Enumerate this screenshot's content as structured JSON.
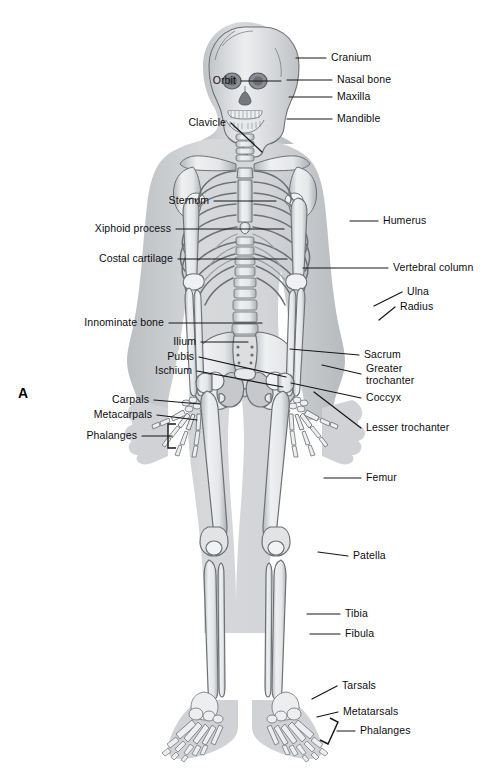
{
  "figure": {
    "panel_letter": "A",
    "view": "anterior"
  },
  "palette": {
    "background": "#ffffff",
    "body_silhouette": "#c9cbcd",
    "body_silhouette_light": "#d8dadc",
    "bone_fill": "#e9eaec",
    "bone_fill_light": "#f2f3f4",
    "bone_shade": "#b0b3b6",
    "bone_outline": "#6d7175",
    "leader_line": "#16161a",
    "label_text": "#0d0d12"
  },
  "labels_left": [
    {
      "id": "orbit",
      "text": "Orbit",
      "x": 236,
      "y": 81,
      "tip_x": 281,
      "tip_y": 81
    },
    {
      "id": "clavicle",
      "text": "Clavicle",
      "x": 226,
      "y": 123,
      "tip_x": 262,
      "tip_y": 152
    },
    {
      "id": "sternum",
      "text": "Sternum",
      "x": 209,
      "y": 201,
      "tip_x": 276,
      "tip_y": 201
    },
    {
      "id": "xiphoid-process",
      "text": "Xiphoid process",
      "x": 171,
      "y": 229,
      "tip_x": 284,
      "tip_y": 229
    },
    {
      "id": "costal-cartilage",
      "text": "Costal cartilage",
      "x": 173,
      "y": 259,
      "tip_x": 287,
      "tip_y": 259
    },
    {
      "id": "innominate-bone",
      "text": "Innominate bone",
      "x": 164,
      "y": 323,
      "tip_x": 262,
      "tip_y": 323
    },
    {
      "id": "ilium",
      "text": "Ilium",
      "x": 196,
      "y": 342,
      "tip_x": 248,
      "tip_y": 342
    },
    {
      "id": "pubis",
      "text": "Pubis",
      "x": 194,
      "y": 357,
      "tip_x": 286,
      "tip_y": 377
    },
    {
      "id": "ischium",
      "text": "Ischium",
      "x": 192,
      "y": 371,
      "tip_x": 283,
      "tip_y": 387
    },
    {
      "id": "carpals",
      "text": "Carpals",
      "x": 149,
      "y": 400,
      "tip_x": 200,
      "tip_y": 404
    },
    {
      "id": "metacarpals",
      "text": "Metacarpals",
      "x": 152,
      "y": 415,
      "tip_x": 197,
      "tip_y": 420
    },
    {
      "id": "phalanges-hand",
      "text": "Phalanges",
      "x": 137,
      "y": 436,
      "tip_x": 172,
      "tip_y": 436
    }
  ],
  "labels_right": [
    {
      "id": "cranium",
      "text": "Cranium",
      "x": 331,
      "y": 58,
      "tip_x": 296,
      "tip_y": 58
    },
    {
      "id": "nasal-bone",
      "text": "Nasal bone",
      "x": 337,
      "y": 80,
      "tip_x": 287,
      "tip_y": 80
    },
    {
      "id": "maxilla",
      "text": "Maxilla",
      "x": 337,
      "y": 97,
      "tip_x": 289,
      "tip_y": 97
    },
    {
      "id": "mandible",
      "text": "Mandible",
      "x": 337,
      "y": 119,
      "tip_x": 287,
      "tip_y": 119
    },
    {
      "id": "humerus",
      "text": "Humerus",
      "x": 383,
      "y": 221,
      "tip_x": 350,
      "tip_y": 221
    },
    {
      "id": "vertebral-column",
      "text": "Vertebral column",
      "x": 393,
      "y": 268,
      "tip_x": 303,
      "tip_y": 268
    },
    {
      "id": "ulna",
      "text": "Ulna",
      "x": 407,
      "y": 292,
      "tip_x": 374,
      "tip_y": 306
    },
    {
      "id": "radius",
      "text": "Radius",
      "x": 400,
      "y": 307,
      "tip_x": 379,
      "tip_y": 320
    },
    {
      "id": "sacrum",
      "text": "Sacrum",
      "x": 364,
      "y": 355,
      "tip_x": 290,
      "tip_y": 349
    },
    {
      "id": "greater-trochanter",
      "text": "Greater\ntrochanter",
      "x": 366,
      "y": 374,
      "tip_x": 322,
      "tip_y": 365
    },
    {
      "id": "coccyx",
      "text": "Coccyx",
      "x": 366,
      "y": 398,
      "tip_x": 291,
      "tip_y": 383
    },
    {
      "id": "lesser-trochanter",
      "text": "Lesser trochanter",
      "x": 366,
      "y": 428,
      "tip_x": 314,
      "tip_y": 392
    },
    {
      "id": "femur",
      "text": "Femur",
      "x": 366,
      "y": 478,
      "tip_x": 324,
      "tip_y": 478
    },
    {
      "id": "patella",
      "text": "Patella",
      "x": 353,
      "y": 556,
      "tip_x": 318,
      "tip_y": 552
    },
    {
      "id": "tibia",
      "text": "Tibia",
      "x": 345,
      "y": 614,
      "tip_x": 307,
      "tip_y": 614
    },
    {
      "id": "fibula",
      "text": "Fibula",
      "x": 345,
      "y": 634,
      "tip_x": 310,
      "tip_y": 634
    },
    {
      "id": "tarsals",
      "text": "Tarsals",
      "x": 342,
      "y": 686,
      "tip_x": 312,
      "tip_y": 699
    },
    {
      "id": "metatarsals",
      "text": "Metatarsals",
      "x": 343,
      "y": 712,
      "tip_x": 317,
      "tip_y": 717
    },
    {
      "id": "phalanges-foot",
      "text": "Phalanges",
      "x": 360,
      "y": 731,
      "tip_x": 337,
      "tip_y": 731
    }
  ]
}
